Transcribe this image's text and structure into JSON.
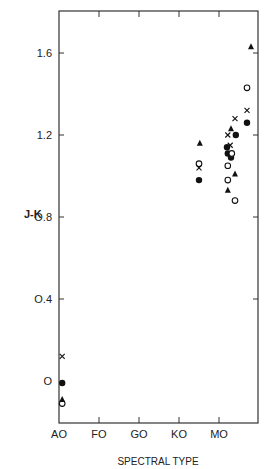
{
  "chart_data": {
    "type": "scatter",
    "title": "",
    "xlabel": "SPECTRAL TYPE",
    "ylabel": "J-K",
    "ylim": [
      -0.2,
      1.8
    ],
    "x_ticks": [
      "AO",
      "FO",
      "GO",
      "KO",
      "MO"
    ],
    "x_tick_positions": [
      0,
      1,
      2,
      3,
      4
    ],
    "xlim": [
      0,
      5
    ],
    "y_ticks": [
      {
        "value": 0.0,
        "label": "O"
      },
      {
        "value": 0.4,
        "label": "O.4"
      },
      {
        "value": 0.8,
        "label": "O.8"
      },
      {
        "value": 1.2,
        "label": "1.2"
      },
      {
        "value": 1.6,
        "label": "1.6"
      }
    ],
    "grid": false,
    "legend": "none",
    "marker_types": {
      "filled-circle": "●",
      "open-circle": "○",
      "triangle": "▲",
      "cross": "x"
    },
    "series": [
      {
        "name": "filled-circle",
        "marker": "filled-circle",
        "points": [
          [
            0.08,
            -0.01
          ],
          [
            3.5,
            0.98
          ],
          [
            4.2,
            1.14
          ],
          [
            4.22,
            1.11
          ],
          [
            4.3,
            1.09
          ],
          [
            4.42,
            1.2
          ],
          [
            4.7,
            1.26
          ]
        ]
      },
      {
        "name": "open-circle",
        "marker": "open-circle",
        "points": [
          [
            0.08,
            -0.11
          ],
          [
            3.5,
            1.06
          ],
          [
            4.22,
            1.05
          ],
          [
            4.22,
            0.98
          ],
          [
            4.32,
            1.11
          ],
          [
            4.4,
            0.88
          ],
          [
            4.7,
            1.43
          ]
        ]
      },
      {
        "name": "triangle",
        "marker": "triangle",
        "points": [
          [
            0.08,
            -0.09
          ],
          [
            3.52,
            1.16
          ],
          [
            4.3,
            1.23
          ],
          [
            4.4,
            1.01
          ],
          [
            4.22,
            0.93
          ],
          [
            4.8,
            1.63
          ]
        ]
      },
      {
        "name": "cross",
        "marker": "cross",
        "points": [
          [
            0.08,
            0.12
          ],
          [
            3.5,
            1.04
          ],
          [
            4.22,
            1.2
          ],
          [
            4.28,
            1.15
          ],
          [
            4.4,
            1.28
          ],
          [
            4.7,
            1.32
          ]
        ]
      }
    ]
  },
  "labels": {
    "ylabel": "J-K",
    "xlabel": "SPECTRAL TYPE"
  }
}
